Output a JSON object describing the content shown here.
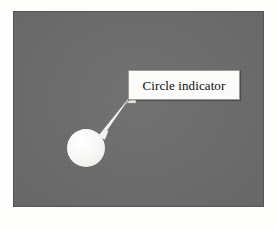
{
  "figure": {
    "kind": "annotated-screenshot",
    "background_color": "#fdfdfc"
  },
  "desktop": {
    "name": "desktop-background",
    "color": "#6b6b6b"
  },
  "objects": {
    "circle": {
      "label": "circle-object",
      "fill_color": "#ffffff",
      "center_x": 86,
      "center_y": 148,
      "radius": 19
    }
  },
  "annotation": {
    "callout": {
      "text": "Circle indicator",
      "text_color": "#0d0d0d",
      "background_color": "#fbfbf9",
      "border_color": "#9a9a96"
    },
    "arrow": {
      "name": "callout-arrow",
      "color": "#f2f2f0",
      "start_x": 130,
      "start_y": 97,
      "end_x": 100,
      "end_y": 133
    }
  },
  "taskbar": {
    "background_color": "#cbcbc8",
    "left_items": [
      {
        "name": "start-button",
        "label": ""
      },
      {
        "name": "quick-launch-icon-1",
        "label": ""
      },
      {
        "name": "quick-launch-icon-2",
        "label": ""
      },
      {
        "name": "quick-launch-icon-3",
        "label": ""
      },
      {
        "name": "task-button-1",
        "label": ""
      }
    ],
    "right_items": [
      {
        "name": "tray-icon-1",
        "label": ""
      },
      {
        "name": "tray-icon-2",
        "label": ""
      },
      {
        "name": "tray-icon-3",
        "label": ""
      },
      {
        "name": "tray-icon-4",
        "label": ""
      },
      {
        "name": "tray-icon-5",
        "label": ""
      },
      {
        "name": "tray-icon-6",
        "label": ""
      },
      {
        "name": "tray-clock",
        "label": ""
      }
    ]
  }
}
